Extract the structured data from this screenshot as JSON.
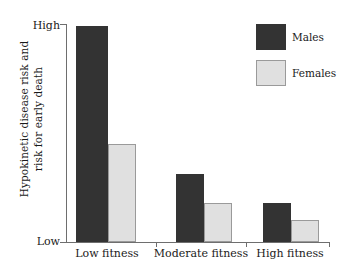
{
  "chart_data": {
    "type": "bar",
    "title": "",
    "subtitle": "",
    "xlabel": "",
    "ylabel": "Hypokinetic disease risk and\nrisk for early death",
    "categories": [
      "Low fitness",
      "Moderate fitness",
      "High fitness"
    ],
    "series": [
      {
        "name": "Males",
        "color": "#333333",
        "values": [
          99,
          31,
          18
        ]
      },
      {
        "name": "Females",
        "color": "#e0e0e0",
        "values": [
          45,
          18,
          10
        ]
      }
    ],
    "ylim": [
      0,
      100
    ],
    "ytick_labels": [
      "Low",
      "High"
    ],
    "ytick_values": [
      0,
      100
    ],
    "grid": false,
    "legend_position": "top-right",
    "legend_entries": [
      "Males",
      "Females"
    ],
    "annotations": []
  },
  "axes": {
    "y_title_line1": "Hypokinetic disease risk and",
    "y_title_line2": "risk for early death",
    "y_high_label": "High",
    "y_low_label": "Low"
  },
  "categories": {
    "c0": "Low fitness",
    "c1": "Moderate fitness",
    "c2": "High fitness"
  },
  "legend": {
    "males_label": "Males",
    "females_label": "Females"
  },
  "colors": {
    "males": "#333333",
    "females": "#e0e0e0",
    "axis": "#6e6e6e",
    "text": "#1a1a1a",
    "background": "#ffffff"
  }
}
